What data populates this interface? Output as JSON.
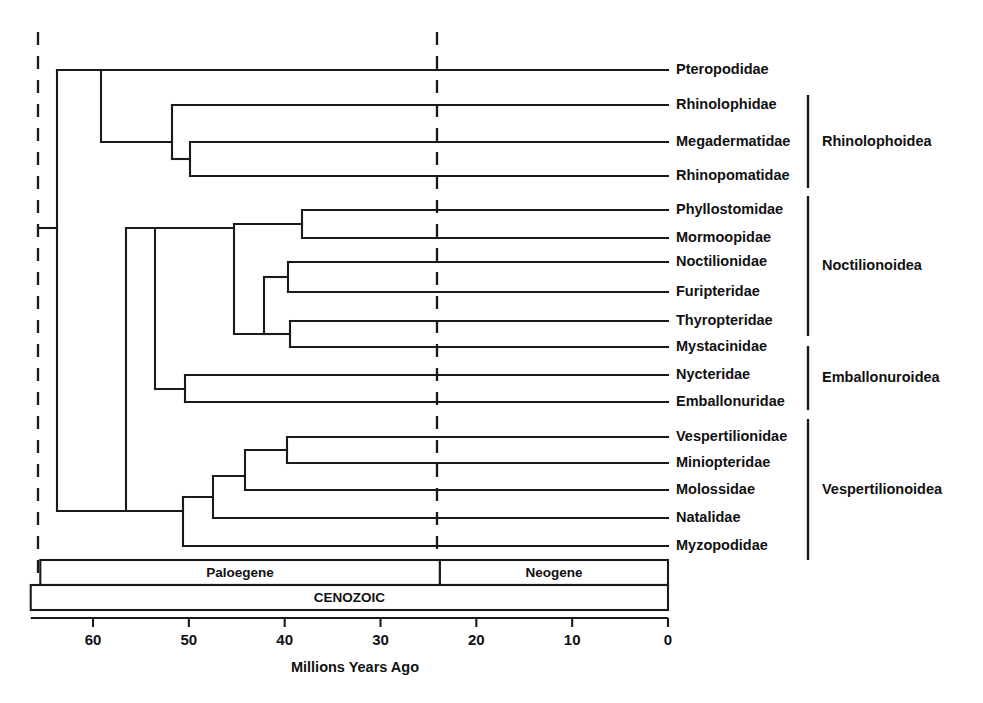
{
  "figure": {
    "axis_title": "Millions Years Ago",
    "ink_color": "#1a1a1a",
    "background": "#ffffff"
  },
  "tips": [
    {
      "label": "Pteropodidae",
      "y": 70,
      "branch_x": 101
    },
    {
      "label": "Rhinolophidae",
      "y": 105,
      "branch_x": 172
    },
    {
      "label": "Megadermatidae",
      "y": 142,
      "branch_x": 190
    },
    {
      "label": "Rhinopomatidae",
      "y": 176,
      "branch_x": 190
    },
    {
      "label": "Phyllostomidae",
      "y": 210,
      "branch_x": 302
    },
    {
      "label": "Mormoopidae",
      "y": 238,
      "branch_x": 302
    },
    {
      "label": "Noctilionidae",
      "y": 262,
      "branch_x": 288
    },
    {
      "label": "Furipteridae",
      "y": 292,
      "branch_x": 288
    },
    {
      "label": "Thyropteridae",
      "y": 321,
      "branch_x": 290
    },
    {
      "label": "Mystacinidae",
      "y": 347,
      "branch_x": 290
    },
    {
      "label": "Nycteridae",
      "y": 375,
      "branch_x": 185
    },
    {
      "label": "Emballonuridae",
      "y": 402,
      "branch_x": 185
    },
    {
      "label": "Vespertilionidae",
      "y": 437,
      "branch_x": 287
    },
    {
      "label": "Miniopteridae",
      "y": 463,
      "branch_x": 287
    },
    {
      "label": "Molossidae",
      "y": 490,
      "branch_x": 245
    },
    {
      "label": "Natalidae",
      "y": 518,
      "branch_x": 213
    },
    {
      "label": "Myzopodidae",
      "y": 546,
      "branch_x": 183
    }
  ],
  "tip_label_x": 676,
  "tip_line_end_x": 668,
  "nodes": [
    {
      "name": "root",
      "x": 57,
      "y_top": 70,
      "y_bottom": 511
    },
    {
      "name": "pteropodid-split",
      "x": 101,
      "y_top": 70,
      "y_bottom": 142
    },
    {
      "name": "rhinolophoid",
      "x": 172,
      "y_top": 105,
      "y_bottom": 159
    },
    {
      "name": "megaderm-rhinopoma",
      "x": 190,
      "y_top": 142,
      "y_bottom": 176
    },
    {
      "name": "yangochiroptera",
      "x": 126,
      "y_top": 228,
      "y_bottom": 511
    },
    {
      "name": "noct-embal",
      "x": 155,
      "y_top": 228,
      "y_bottom": 389
    },
    {
      "name": "noctilionoidea",
      "x": 234,
      "y_top": 224,
      "y_bottom": 334
    },
    {
      "name": "phyllo-mormoop",
      "x": 302,
      "y_top": 210,
      "y_bottom": 238
    },
    {
      "name": "noct-furi-thyro-myst",
      "x": 264,
      "y_top": 277,
      "y_bottom": 334
    },
    {
      "name": "noct-furi",
      "x": 288,
      "y_top": 262,
      "y_bottom": 292
    },
    {
      "name": "thyro-myst",
      "x": 290,
      "y_top": 321,
      "y_bottom": 347
    },
    {
      "name": "emballonuroidea",
      "x": 185,
      "y_top": 375,
      "y_bottom": 402
    },
    {
      "name": "vespertilionoidea",
      "x": 183,
      "y_top": 497,
      "y_bottom": 546
    },
    {
      "name": "natalid-split",
      "x": 213,
      "y_top": 476,
      "y_bottom": 518
    },
    {
      "name": "molossid-split",
      "x": 245,
      "y_top": 450,
      "y_bottom": 490
    },
    {
      "name": "vesper-miniopterid",
      "x": 287,
      "y_top": 437,
      "y_bottom": 463
    }
  ],
  "clades": [
    {
      "label": "Rhinolophoidea",
      "bracket_x": 808,
      "y_top": 95,
      "y_bottom": 188,
      "label_x": 822,
      "label_y": 142
    },
    {
      "label": "Noctilionoidea",
      "bracket_x": 808,
      "y_top": 196,
      "y_bottom": 336,
      "label_x": 822,
      "label_y": 266
    },
    {
      "label": "Emballonuroidea",
      "bracket_x": 808,
      "y_top": 346,
      "y_bottom": 410,
      "label_x": 822,
      "label_y": 378
    },
    {
      "label": "Vespertilionoidea",
      "bracket_x": 808,
      "y_top": 419,
      "y_bottom": 560,
      "label_x": 822,
      "label_y": 490
    }
  ],
  "timescale": {
    "epochs": [
      {
        "label": "Paloegene",
        "from_ma": 65.5,
        "to_ma": 23.8
      },
      {
        "label": "Neogene",
        "from_ma": 23.8,
        "to_ma": 0
      }
    ],
    "era": {
      "label": "CENOZOIC",
      "from_ma": 66.5,
      "to_ma": 0
    },
    "ticks": [
      60,
      50,
      40,
      30,
      20,
      10,
      0
    ],
    "axis_title": "Millions Years Ago",
    "x_at_0_ma": 668,
    "px_per_ma": 9.583,
    "epoch_bar": {
      "top": 560,
      "height": 25
    },
    "era_bar": {
      "top": 585,
      "height": 25
    },
    "axis_y": 618,
    "tick_length": 9,
    "tick_label_y": 634,
    "axis_title_x": 355,
    "axis_title_y": 668
  },
  "dashed_lines": [
    {
      "name": "root-dashed-line",
      "x": 38,
      "y_top": 32,
      "y_bottom": 580,
      "ma": 65.8
    },
    {
      "name": "epoch-dashed-line",
      "x": 437,
      "y_top": 32,
      "y_bottom": 560,
      "ma": 24.1
    }
  ],
  "root_stem": {
    "x_start": 38,
    "x_end": 57,
    "y": 228
  }
}
